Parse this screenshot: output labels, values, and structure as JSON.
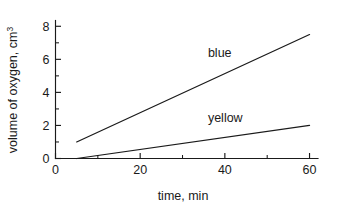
{
  "chart_data": {
    "type": "line",
    "title": "",
    "subtitle": "",
    "xlabel": "time, min",
    "ylabel": "volume of oxygen, cm",
    "ylabel_superscript": "3",
    "xlim": [
      0,
      62
    ],
    "ylim": [
      0,
      8.35
    ],
    "grid": false,
    "legend_position": "inline-annotation",
    "x_ticks_major": [
      0,
      20,
      40,
      60
    ],
    "x_tick_labels": [
      "0",
      "20",
      "40",
      "60"
    ],
    "x_ticks_minor": [
      10,
      30,
      50
    ],
    "y_ticks_major": [
      0,
      2,
      4,
      6,
      8
    ],
    "y_tick_labels": [
      "0",
      "2",
      "4",
      "6",
      "8"
    ],
    "y_ticks_minor": [
      1,
      3,
      5,
      7
    ],
    "series": [
      {
        "name": "blue",
        "label": "blue",
        "color": "#1a1a1a",
        "x": [
          5,
          60
        ],
        "values": [
          1.0,
          7.5
        ],
        "label_x": 36,
        "label_y": 6.15
      },
      {
        "name": "yellow",
        "label": "yellow",
        "color": "#1a1a1a",
        "x": [
          5,
          60
        ],
        "values": [
          0.0,
          2.0
        ],
        "label_x": 36,
        "label_y": 2.2
      }
    ]
  },
  "axes": {
    "x_axis_name": "time, min",
    "y_axis_name": "volume of oxygen, cm3"
  }
}
